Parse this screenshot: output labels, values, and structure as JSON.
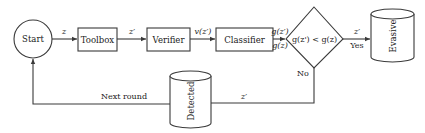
{
  "diagram": {
    "nodes": {
      "start": {
        "label": "Start",
        "shape": "circle"
      },
      "toolbox": {
        "label": "Toolbox",
        "shape": "rectangle"
      },
      "verifier": {
        "label": "Verifier",
        "shape": "rectangle"
      },
      "classifier": {
        "label": "Classifier",
        "shape": "rectangle"
      },
      "decision": {
        "label": "g(z') < g(z)",
        "shape": "diamond"
      },
      "evasive": {
        "label": "Evasive",
        "shape": "cylinder"
      },
      "detected": {
        "label": "Detected",
        "shape": "cylinder"
      }
    },
    "edges": {
      "start_toolbox": {
        "label": "z"
      },
      "toolbox_verifier": {
        "label": "z′"
      },
      "verifier_classifier": {
        "label": "v(z′)"
      },
      "classifier_decision_top": {
        "label": "g(z′)"
      },
      "classifier_decision_bottom": {
        "label": "g(z)"
      },
      "decision_evasive_top": {
        "label": "z′"
      },
      "decision_evasive_bottom": {
        "label": "Yes"
      },
      "decision_no": {
        "label": "No"
      },
      "no_to_detected": {
        "label": "z′"
      },
      "detected_to_start": {
        "label": "Next round"
      }
    },
    "colors": {
      "stroke": "#3a3a3a",
      "text": "#1a1a1a",
      "background": "#ffffff"
    }
  }
}
